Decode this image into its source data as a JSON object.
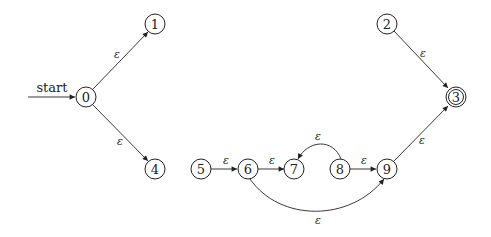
{
  "diagram": {
    "type": "NFA",
    "start_label": "start",
    "epsilon": "ε",
    "nodes": [
      {
        "id": "0",
        "label": "0",
        "accepting": false,
        "start": true
      },
      {
        "id": "1",
        "label": "1",
        "accepting": false
      },
      {
        "id": "2",
        "label": "2",
        "accepting": false
      },
      {
        "id": "3",
        "label": "3",
        "accepting": true
      },
      {
        "id": "4",
        "label": "4",
        "accepting": false
      },
      {
        "id": "5",
        "label": "5",
        "accepting": false
      },
      {
        "id": "6",
        "label": "6",
        "accepting": false
      },
      {
        "id": "7",
        "label": "7",
        "accepting": false
      },
      {
        "id": "8",
        "label": "8",
        "accepting": false
      },
      {
        "id": "9",
        "label": "9",
        "accepting": false
      }
    ],
    "edges": [
      {
        "from": "0",
        "to": "1",
        "label": "ε"
      },
      {
        "from": "0",
        "to": "4",
        "label": "ε"
      },
      {
        "from": "2",
        "to": "3",
        "label": "ε"
      },
      {
        "from": "5",
        "to": "6",
        "label": "ε"
      },
      {
        "from": "6",
        "to": "7",
        "label": "ε"
      },
      {
        "from": "8",
        "to": "7",
        "label": "ε"
      },
      {
        "from": "8",
        "to": "9",
        "label": "ε"
      },
      {
        "from": "6",
        "to": "9",
        "label": "ε"
      },
      {
        "from": "9",
        "to": "3",
        "label": "ε"
      }
    ]
  }
}
